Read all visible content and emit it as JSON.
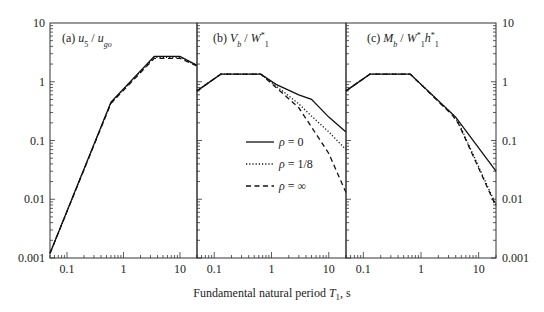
{
  "chart_data": {
    "type": "line",
    "scale": {
      "x": "log",
      "y": "log"
    },
    "xlabel": "Fundamental natural period T1, s",
    "xlim": [
      0.05,
      20
    ],
    "ylim": [
      0.001,
      10
    ],
    "x_ticks": [
      0.1,
      1,
      10
    ],
    "x_tick_labels": [
      "0.1",
      "1",
      "10"
    ],
    "y_ticks": [
      0.001,
      0.01,
      0.1,
      1,
      10
    ],
    "y_tick_labels": [
      "0.001",
      "0.01",
      "0.1",
      "1",
      "10"
    ],
    "grid": false,
    "legend": {
      "position": "inside panel (b), lower-middle",
      "entries": [
        {
          "label": "ρ = 0",
          "style": "solid"
        },
        {
          "label": "ρ = 1/8",
          "style": "dotted"
        },
        {
          "label": "ρ = ∞",
          "style": "dashed"
        }
      ]
    },
    "panels": [
      {
        "id": "a",
        "title": "(a) u5 / ugo",
        "series": [
          {
            "name": "ρ = 0",
            "style": "solid",
            "x": [
              0.05,
              0.6,
              3.5,
              10,
              20
            ],
            "y": [
              0.0012,
              0.45,
              2.7,
              2.7,
              1.9
            ]
          },
          {
            "name": "ρ = 1/8",
            "style": "dotted",
            "x": [
              0.05,
              0.6,
              3.5,
              10,
              20
            ],
            "y": [
              0.0012,
              0.44,
              2.6,
              2.6,
              1.9
            ]
          },
          {
            "name": "ρ = ∞",
            "style": "dashed",
            "x": [
              0.05,
              0.6,
              3.5,
              10,
              20
            ],
            "y": [
              0.0012,
              0.43,
              2.5,
              2.5,
              1.85
            ]
          }
        ]
      },
      {
        "id": "b",
        "title": "(b) Vb / W1*",
        "series": [
          {
            "name": "ρ = 0",
            "style": "solid",
            "x": [
              0.05,
              0.13,
              0.65,
              1.2,
              3.0,
              5.0,
              10,
              20
            ],
            "y": [
              0.7,
              1.35,
              1.35,
              0.9,
              0.6,
              0.5,
              0.25,
              0.14
            ]
          },
          {
            "name": "ρ = 1/8",
            "style": "dotted",
            "x": [
              0.05,
              0.13,
              0.65,
              1.2,
              3.0,
              5.0,
              10,
              20
            ],
            "y": [
              0.7,
              1.35,
              1.35,
              0.85,
              0.42,
              0.26,
              0.14,
              0.07
            ]
          },
          {
            "name": "ρ = ∞",
            "style": "dashed",
            "x": [
              0.05,
              0.13,
              0.65,
              1.2,
              3.0,
              5.0,
              10,
              20
            ],
            "y": [
              0.7,
              1.35,
              1.35,
              0.8,
              0.36,
              0.17,
              0.06,
              0.013
            ]
          }
        ]
      },
      {
        "id": "c",
        "title": "(c) Mb / W1*h1*",
        "series": [
          {
            "name": "ρ = 0",
            "style": "solid",
            "x": [
              0.05,
              0.13,
              0.65,
              4.0,
              20
            ],
            "y": [
              0.7,
              1.35,
              1.35,
              0.25,
              0.03
            ]
          },
          {
            "name": "ρ = 1/8",
            "style": "dotted",
            "x": [
              0.05,
              0.13,
              0.65,
              3.5,
              4.5,
              20
            ],
            "y": [
              0.7,
              1.35,
              1.35,
              0.28,
              0.2,
              0.008
            ]
          },
          {
            "name": "ρ = ∞",
            "style": "dashed",
            "x": [
              0.05,
              0.13,
              0.65,
              3.5,
              4.5,
              20
            ],
            "y": [
              0.7,
              1.35,
              1.35,
              0.27,
              0.19,
              0.0075
            ]
          }
        ]
      }
    ]
  },
  "labels": {
    "xlabel_prefix": "Fundamental natural period ",
    "xlabel_symbol": "T",
    "xlabel_sub": "1",
    "xlabel_suffix": ", s"
  }
}
